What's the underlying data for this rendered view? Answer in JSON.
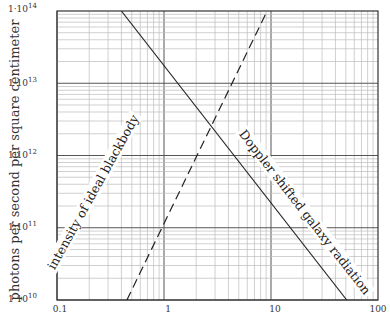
{
  "chart_data": {
    "type": "line",
    "title": "",
    "xlabel": "",
    "ylabel": "photons per second per square centimeter",
    "xscale": "log",
    "yscale": "log",
    "xlim": [
      0.1,
      100
    ],
    "ylim": [
      10000000000.0,
      100000000000000.0
    ],
    "grid": true,
    "x_ticks": [
      "0.1",
      "1",
      "10",
      "100"
    ],
    "y_ticks": [
      {
        "base": "1·10",
        "exp": "10"
      },
      {
        "base": "1·10",
        "exp": "11"
      },
      {
        "base": "1·10",
        "exp": "12"
      },
      {
        "base": "1·10",
        "exp": "13"
      },
      {
        "base": "1·10",
        "exp": "14"
      }
    ],
    "series": [
      {
        "name": "Doppler shifted galaxy radiation",
        "style": "solid",
        "x": [
          0.4,
          51
        ],
        "y": [
          100000000000000.0,
          10000000000.0
        ]
      },
      {
        "name": "intensity of ideal blackbody",
        "style": "dashed",
        "x": [
          0.45,
          9.2
        ],
        "y": [
          10000000000.0,
          100000000000000.0
        ]
      }
    ],
    "annotations": [
      "intensity of ideal blackbody",
      "Doppler shifted galaxy radiation"
    ]
  }
}
